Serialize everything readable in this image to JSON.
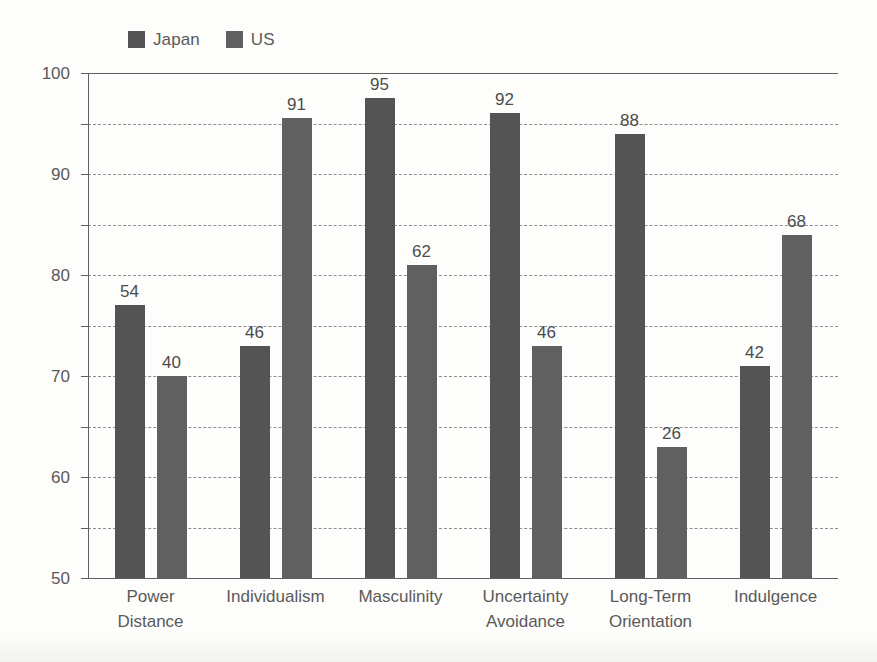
{
  "chart_data": {
    "type": "bar",
    "title": "",
    "xlabel": "",
    "ylabel": "",
    "ylim": [
      0,
      100
    ],
    "ytick_step": 10,
    "yticks": [
      "100",
      "90",
      "80",
      "70",
      "60",
      "50",
      "40",
      "30",
      "20",
      "10",
      "0"
    ],
    "grid": true,
    "legend_position": "top-left",
    "categories": [
      "Power Distance",
      "Individualism",
      "Masculinity",
      "Uncertainty Avoidance",
      "Long-Term Orientation",
      "Indulgence"
    ],
    "category_lines": [
      [
        "Power",
        "Distance"
      ],
      [
        "Individualism"
      ],
      [
        "Masculinity"
      ],
      [
        "Uncertainty",
        "Avoidance"
      ],
      [
        "Long-Term",
        "Orientation"
      ],
      [
        "Indulgence"
      ]
    ],
    "series": [
      {
        "name": "Japan",
        "color": "#545454",
        "values": [
          54,
          46,
          95,
          92,
          88,
          42
        ]
      },
      {
        "name": "US",
        "color": "#606060",
        "values": [
          40,
          91,
          62,
          46,
          26,
          68
        ]
      }
    ]
  },
  "legend": {
    "items": [
      {
        "label": "Japan",
        "color": "#545454"
      },
      {
        "label": "US",
        "color": "#606060"
      }
    ]
  },
  "colors": {
    "background": "#fdfdfc",
    "axis": "#5f5f5f",
    "gridline": "#8e8e8e",
    "text": "#5a5a5a",
    "value_text": "#4c4c4c",
    "series_japan": "#545454",
    "series_us": "#606060"
  }
}
